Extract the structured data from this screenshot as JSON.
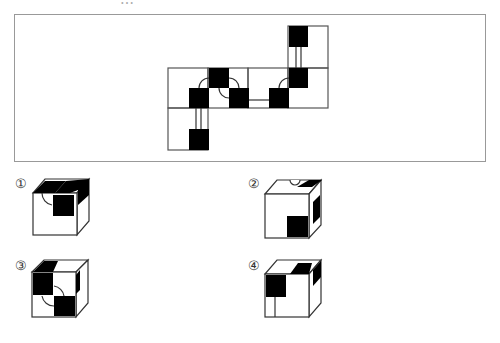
{
  "question": {
    "header_text_partial": "…"
  },
  "net": {
    "description": "Unfolded cube net with black squares and arc markings"
  },
  "options": [
    {
      "label": "①"
    },
    {
      "label": "②"
    },
    {
      "label": "③"
    },
    {
      "label": "④"
    }
  ]
}
